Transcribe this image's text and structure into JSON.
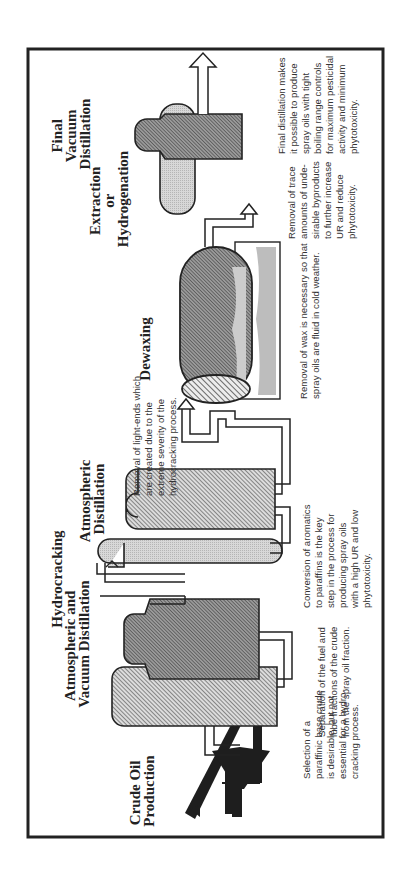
{
  "diagram": {
    "type": "process-flow",
    "orientation": "rotated-90-ccw",
    "colors": {
      "frame": "#222222",
      "outline": "#222222",
      "dark_fill": "#8a8a8a",
      "light_fill": "#cfcfcf",
      "hatch": "#444444",
      "wax_shadow": "#bdbdbd"
    },
    "stages": [
      {
        "id": "crude-oil-production",
        "title_lines": [
          "Crude Oil",
          "Production"
        ],
        "icon": "oil-pump-jack-icon",
        "note_lines": [
          "Selection of a",
          "paraffinic base crude",
          "is desirable, but not",
          "essential for a hydro-",
          "cracking process."
        ]
      },
      {
        "id": "atmospheric-and-vacuum-distillation",
        "title_lines": [
          "Atmospheric  and",
          "Vacuum Distillation"
        ],
        "icon": "distillation-column-pair-icon",
        "note_lines": [
          "Separation of the fuel and",
          "lube fractions of the crude",
          "from the spray oil fraction."
        ]
      },
      {
        "id": "hydrocracking",
        "title_lines": [
          "Hydrocracking"
        ],
        "icon": "reactor-vessel-icon",
        "note_lines": [
          "Conversion of aromatics",
          "to paraffins is the key",
          "step in the process for",
          "producing spray oils",
          "with a high UR and low",
          "phytotoxicity."
        ]
      },
      {
        "id": "atmospheric-distillation",
        "title_lines": [
          "Atmospheric",
          "Distillation"
        ],
        "icon": "distillation-column-icon",
        "note_lines": [
          "Removal of light-ends which",
          "are created due to the",
          "extreme severity of the",
          "hydrocracking process."
        ]
      },
      {
        "id": "dewaxing",
        "title_lines": [
          "Dewaxing"
        ],
        "icon": "dewaxing-drum-icon",
        "note_lines": [
          "Removal of wax is necessary so that",
          "spray oils are fluid in cold weather."
        ]
      },
      {
        "id": "extraction-or-hydrogenation",
        "title_lines": [
          "Extraction",
          "or",
          "Hydrogenation"
        ],
        "icon": "treater-vessel-icon",
        "note_lines": [
          "Removal of trace",
          "amounts of unde-",
          "sirable byproducts",
          "to further increase",
          "UR and reduce",
          "phytotoxicity."
        ]
      },
      {
        "id": "final-vacuum-distillation",
        "title_lines": [
          "Final",
          "Vacuum",
          "Distillation"
        ],
        "icon": "vacuum-column-icon",
        "note_lines": [
          "Final distillation makes",
          "it possible to produce",
          "spray oils with tight",
          "boiling range controls",
          "for maximum pesticidal",
          "activity and minimum",
          "phytotoxicity."
        ]
      }
    ],
    "output_arrow": "product-output-arrow"
  }
}
